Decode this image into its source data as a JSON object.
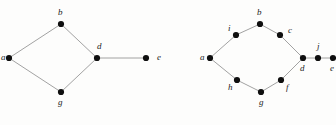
{
  "figure": {
    "title": "",
    "background_color": "#fdfdfc",
    "edge_color": "#8a8a8a",
    "vertex_color": "#0f0f0f",
    "label_color": "#1c1c1c",
    "vertex_radius": 3.1,
    "edge_width": 0.8
  },
  "graphs": [
    {
      "id": "graph-left",
      "name": "left-graph",
      "vertices": [
        {
          "id": "a",
          "label": "a",
          "x": 9,
          "y": 58,
          "label_x": 1,
          "label_y": 53
        },
        {
          "id": "b",
          "label": "b",
          "x": 61,
          "y": 24,
          "label_x": 58,
          "label_y": 8
        },
        {
          "id": "d",
          "label": "d",
          "x": 97,
          "y": 58,
          "label_x": 97,
          "label_y": 42
        },
        {
          "id": "e",
          "label": "e",
          "x": 146,
          "y": 58,
          "label_x": 157,
          "label_y": 53
        },
        {
          "id": "g",
          "label": "g",
          "x": 61,
          "y": 92,
          "label_x": 58,
          "label_y": 98
        }
      ],
      "edges": [
        {
          "from": "a",
          "to": "b"
        },
        {
          "from": "b",
          "to": "d"
        },
        {
          "from": "a",
          "to": "g"
        },
        {
          "from": "g",
          "to": "d"
        },
        {
          "from": "d",
          "to": "e"
        }
      ]
    },
    {
      "id": "graph-right",
      "name": "right-graph",
      "vertices": [
        {
          "id": "a",
          "label": "a",
          "x": 210,
          "y": 58,
          "label_x": 200,
          "label_y": 53
        },
        {
          "id": "i",
          "label": "i",
          "x": 236,
          "y": 35,
          "label_x": 228,
          "label_y": 24
        },
        {
          "id": "b",
          "label": "b",
          "x": 260,
          "y": 24,
          "label_x": 257,
          "label_y": 8
        },
        {
          "id": "c",
          "label": "c",
          "x": 280,
          "y": 35,
          "label_x": 288,
          "label_y": 26
        },
        {
          "id": "d",
          "label": "d",
          "x": 303,
          "y": 58,
          "label_x": 300,
          "label_y": 64
        },
        {
          "id": "j",
          "label": "j",
          "x": 318,
          "y": 58,
          "label_x": 317,
          "label_y": 42
        },
        {
          "id": "e",
          "label": "e",
          "x": 333,
          "y": 58,
          "label_x": 330,
          "label_y": 64
        },
        {
          "id": "f",
          "label": "f",
          "x": 281,
          "y": 80,
          "label_x": 286,
          "label_y": 83
        },
        {
          "id": "g",
          "label": "g",
          "x": 261,
          "y": 92,
          "label_x": 259,
          "label_y": 98
        },
        {
          "id": "h",
          "label": "h",
          "x": 237,
          "y": 80,
          "label_x": 228,
          "label_y": 83
        }
      ],
      "edges": [
        {
          "from": "a",
          "to": "i"
        },
        {
          "from": "i",
          "to": "b"
        },
        {
          "from": "b",
          "to": "c"
        },
        {
          "from": "c",
          "to": "d"
        },
        {
          "from": "a",
          "to": "h"
        },
        {
          "from": "h",
          "to": "g"
        },
        {
          "from": "g",
          "to": "f"
        },
        {
          "from": "f",
          "to": "d"
        },
        {
          "from": "d",
          "to": "j"
        },
        {
          "from": "j",
          "to": "e"
        }
      ]
    }
  ]
}
